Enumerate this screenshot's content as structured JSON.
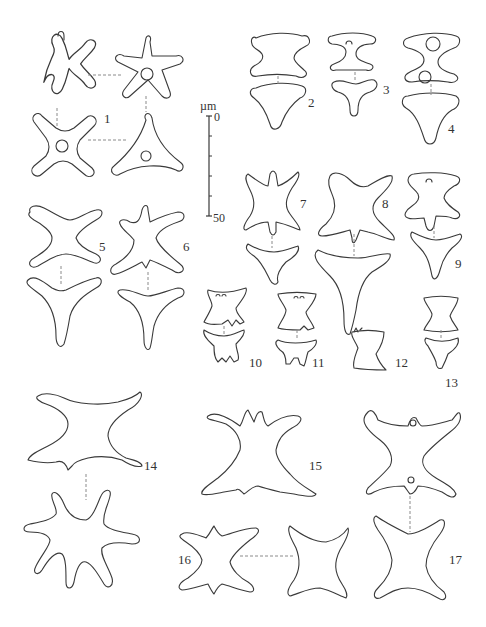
{
  "figure": {
    "type": "taxonomic line-drawing plate",
    "background": "#ffffff",
    "stroke_color": "#3a3a3a",
    "connector_color": "#8a8a8a"
  },
  "scale_bar": {
    "unit": "µm",
    "start_label": "0",
    "end_label": "50",
    "minor_ticks": 4
  },
  "labels": [
    {
      "id": "1",
      "text": "1"
    },
    {
      "id": "2",
      "text": "2"
    },
    {
      "id": "3",
      "text": "3"
    },
    {
      "id": "4",
      "text": "4"
    },
    {
      "id": "5",
      "text": "5"
    },
    {
      "id": "6",
      "text": "6"
    },
    {
      "id": "7",
      "text": "7"
    },
    {
      "id": "8",
      "text": "8"
    },
    {
      "id": "9",
      "text": "9"
    },
    {
      "id": "10",
      "text": "10"
    },
    {
      "id": "11",
      "text": "11"
    },
    {
      "id": "12",
      "text": "12"
    },
    {
      "id": "13",
      "text": "13"
    },
    {
      "id": "14",
      "text": "14"
    },
    {
      "id": "15",
      "text": "15"
    },
    {
      "id": "16",
      "text": "16"
    },
    {
      "id": "17",
      "text": "17"
    }
  ]
}
